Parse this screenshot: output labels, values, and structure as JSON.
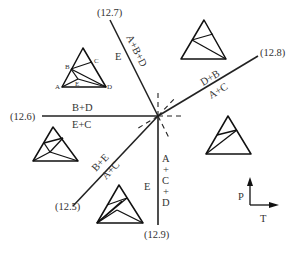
{
  "reactions": [
    {
      "id": "12.7",
      "label": "(12.7)",
      "side_a": "E",
      "side_b": "A+B+D"
    },
    {
      "id": "12.8",
      "label": "(12.8)",
      "side_a": "D+B",
      "side_b": "A+C"
    },
    {
      "id": "12.6",
      "label": "(12.6)",
      "side_a": "B+D",
      "side_b": "E+C"
    },
    {
      "id": "12.5",
      "label": "(12.5)",
      "side_a": "B+E",
      "side_b": "A+C"
    },
    {
      "id": "12.9",
      "label": "(12.9)",
      "side_a": "E",
      "side_b": [
        "A",
        "+",
        "C",
        "+",
        "D"
      ]
    }
  ],
  "reference_triangle": {
    "points": [
      "A",
      "B",
      "C",
      "D",
      "E"
    ]
  },
  "axes": {
    "y_label": "P",
    "x_label": "T"
  }
}
